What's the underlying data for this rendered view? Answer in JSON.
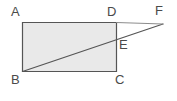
{
  "figure": {
    "kind": "geometry-diagram",
    "background_color": "#ffffff",
    "fill_color": "#e9e9e9",
    "stroke_color": "#555555",
    "label_color": "#4a4a4a",
    "stroke_width": 1.2
  },
  "shape": {
    "rectangle": {
      "name": "ABCD",
      "corners": {
        "A": {
          "x": 22.5,
          "y": 22.5
        },
        "D": {
          "x": 116.5,
          "y": 22.5
        },
        "C": {
          "x": 116.5,
          "y": 71.5
        },
        "B": {
          "x": 22.5,
          "y": 71.5
        }
      },
      "points_string": "22.5,22.5 116.5,22.5 116.5,71.5 22.5,71.5"
    },
    "external_point": {
      "F": {
        "x": 163.0,
        "y": 24.0
      }
    },
    "intersection_point": {
      "E": {
        "x": 116.5,
        "y": 39.0
      }
    },
    "segments": [
      {
        "name": "BF",
        "from": "B",
        "to": "F",
        "x1": 22.5,
        "y1": 71.5,
        "x2": 163.0,
        "y2": 24.0
      },
      {
        "name": "DF",
        "from": "D",
        "to": "F",
        "x1": 116.5,
        "y1": 22.5,
        "x2": 163.0,
        "y2": 24.0
      }
    ]
  },
  "labels": {
    "A": {
      "text": "A",
      "x": 11,
      "y": 5
    },
    "B": {
      "text": "B",
      "x": 11,
      "y": 73
    },
    "C": {
      "text": "C",
      "x": 115,
      "y": 73
    },
    "D": {
      "text": "D",
      "x": 107,
      "y": 5
    },
    "E": {
      "text": "E",
      "x": 119,
      "y": 38
    },
    "F": {
      "text": "F",
      "x": 155,
      "y": 4
    }
  }
}
